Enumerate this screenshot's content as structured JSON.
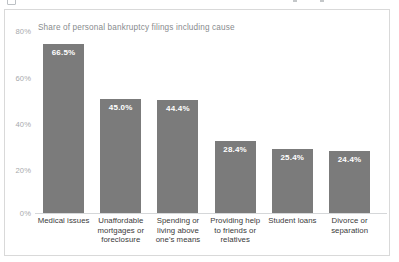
{
  "window": {
    "top_strip_icons": [
      "app-icon",
      "toolbar-mark",
      "toolbar-mark"
    ]
  },
  "card": {
    "subtitle": "Share of personal bankruptcy filings including cause"
  },
  "colors": {
    "bar_fill": "#7b7b7b",
    "bar_label_text": "#ffffff",
    "subtitle_text": "#888b8e",
    "axis_tick_text": "#a7a9ac",
    "category_text": "#3a3a3a",
    "card_border": "#d9d9d9",
    "baseline": "#d5d7d9",
    "background": "#ffffff"
  },
  "chart_data": {
    "type": "bar",
    "title": "",
    "subtitle": "Share of personal bankruptcy filings including cause",
    "xlabel": "",
    "ylabel": "",
    "ylim": [
      0,
      80
    ],
    "grid": false,
    "legend": false,
    "orientation": "vertical",
    "value_suffix": "%",
    "yticks": [
      0,
      20,
      40,
      60,
      80
    ],
    "ytick_labels": [
      "0%",
      "20%",
      "40%",
      "60%",
      "80%"
    ],
    "categories": [
      "Medical issues",
      "Unaffordable mortgages or foreclosure",
      "Spending or living above one's means",
      "Providing help to friends or relatives",
      "Student loans",
      "Divorce or separation"
    ],
    "category_label_lines": [
      [
        "Medical issues"
      ],
      [
        "Unaffordable",
        "mortgages or",
        "foreclosure"
      ],
      [
        "Spending or",
        "living above",
        "one's means"
      ],
      [
        "Providing help",
        "to friends or",
        "relatives"
      ],
      [
        "Student loans"
      ],
      [
        "Divorce or",
        "separation"
      ]
    ],
    "values": [
      66.5,
      45.0,
      44.4,
      28.4,
      25.4,
      24.4
    ],
    "data_labels": [
      "66.5%",
      "45.0%",
      "44.4%",
      "28.4%",
      "25.4%",
      "24.4%"
    ]
  }
}
